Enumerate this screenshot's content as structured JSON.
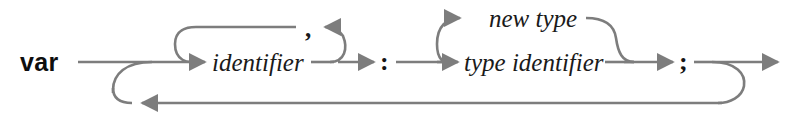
{
  "diagram": {
    "kind": "railroad-syntax-diagram",
    "title": "var",
    "line_color": "#7d7d7d",
    "text_color": "#141414",
    "background_color": "#ffffff",
    "nodes": {
      "keyword_var": {
        "label": "var",
        "type": "terminal",
        "x": 20,
        "y": 71
      },
      "identifier": {
        "label": "identifier",
        "type": "nonterminal",
        "x": 212,
        "y": 71
      },
      "comma": {
        "label": ",",
        "type": "terminal",
        "x": 309,
        "y": 37
      },
      "colon": {
        "label": ":",
        "type": "terminal",
        "x": 382,
        "y": 72
      },
      "new_type": {
        "label": "new type",
        "type": "nonterminal",
        "x": 489,
        "y": 28
      },
      "type_identifier": {
        "label": "type identifier",
        "type": "nonterminal",
        "x": 464,
        "y": 71
      },
      "semicolon": {
        "label": ";",
        "type": "terminal",
        "x": 681,
        "y": 72
      }
    },
    "rails": {
      "main_y": 62,
      "upper_loop_y": 27,
      "branch_top_y": 18,
      "return_y": 103
    },
    "paths": [
      {
        "name": "entry-rail",
        "from": "start",
        "to": "identifier"
      },
      {
        "name": "identifier-repeat-loop",
        "from": "identifier",
        "to": "identifier",
        "separator": ","
      },
      {
        "name": "colon-rail",
        "from": "identifier",
        "to": "colon"
      },
      {
        "name": "type-branch-new-type",
        "from": "colon",
        "to": "new type"
      },
      {
        "name": "type-branch-type-identifier",
        "from": "colon",
        "to": "type identifier"
      },
      {
        "name": "semicolon-rail",
        "from": "type",
        "to": ";"
      },
      {
        "name": "declaration-repeat-return",
        "from": ";",
        "to": "entry"
      },
      {
        "name": "exit-rail",
        "from": ";",
        "to": "end"
      }
    ]
  }
}
